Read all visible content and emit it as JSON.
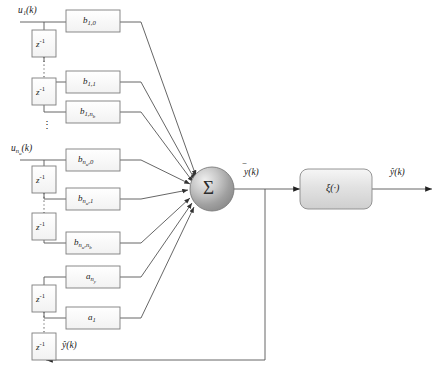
{
  "diagram": {
    "colors": {
      "line": "#555555",
      "box_border": "#7d7d7d",
      "box_fill_light": "#f4f4f4",
      "box_fill_dark": "#d8d8d8",
      "node_dark": "#8c8c8c",
      "node_light": "#e8e8e8",
      "text": "#1a1a1a",
      "background": "#ffffff"
    },
    "inputs": [
      {
        "id": "u1",
        "label": "u₁(k)"
      },
      {
        "id": "unu",
        "label": "u_{n_u}(k)"
      }
    ],
    "delay_label": "z⁻¹",
    "sum_label": "Σ",
    "activation_label": "ξ(·)",
    "intermediate_output": "ȳ(k)",
    "final_output": "ŷ(k)",
    "feedback_label": "ŷ(k)",
    "coefficient_blocks": [
      {
        "id": "b10",
        "label": "b₁,₀",
        "group": "u1"
      },
      {
        "id": "b11",
        "label": "b₁,₁",
        "group": "u1"
      },
      {
        "id": "b1nb",
        "label": "b₁,n_b",
        "group": "u1"
      },
      {
        "id": "bnu0",
        "label": "b_{n_u},0",
        "group": "unu"
      },
      {
        "id": "bnu1",
        "label": "b_{n_u},1",
        "group": "unu"
      },
      {
        "id": "bnunb",
        "label": "b_{n_u},n_b",
        "group": "unu"
      },
      {
        "id": "any",
        "label": "a_{n_y}",
        "group": "feedback"
      },
      {
        "id": "a1",
        "label": "a₁",
        "group": "feedback"
      }
    ],
    "ellipsis_marks": [
      "vertical-dots-u1",
      "vertical-dots-unu",
      "vertical-dots-feedback",
      "group-separator-dots"
    ]
  }
}
